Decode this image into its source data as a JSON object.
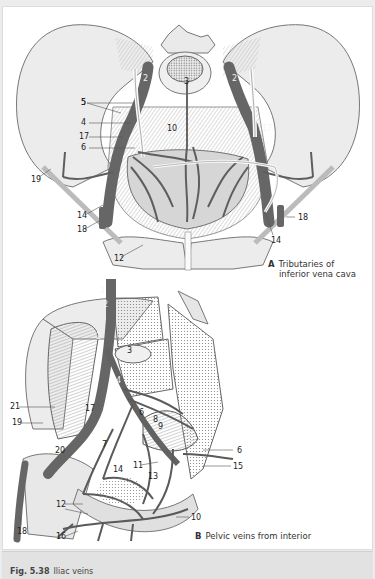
{
  "figure": {
    "caption": {
      "number": "Fig. 5.38",
      "title": "Iliac veins"
    }
  },
  "panel_a": {
    "letter": "A",
    "title_line1": "Tributaries of",
    "title_line2": "inferior vena cava",
    "labels": [
      {
        "text": "2",
        "x": 140,
        "y": 68,
        "inv": true
      },
      {
        "text": "2",
        "x": 229,
        "y": 68,
        "inv": true
      },
      {
        "text": "3",
        "x": 181,
        "y": 71,
        "inv": false
      },
      {
        "text": "5",
        "x": 78,
        "y": 92,
        "inv": false
      },
      {
        "text": "5",
        "x": 78,
        "y": 92,
        "inv": false
      },
      {
        "text": "4",
        "x": 78,
        "y": 112,
        "inv": false
      },
      {
        "text": "4",
        "x": 230,
        "y": 106,
        "inv": true
      },
      {
        "text": "10",
        "x": 164,
        "y": 118,
        "inv": false
      },
      {
        "text": "17",
        "x": 76,
        "y": 126,
        "inv": false
      },
      {
        "text": "17",
        "x": 259,
        "y": 118,
        "inv": true
      },
      {
        "text": "11",
        "x": 164,
        "y": 131,
        "inv": true
      },
      {
        "text": "6",
        "x": 78,
        "y": 137,
        "inv": false
      },
      {
        "text": "19",
        "x": 28,
        "y": 169,
        "inv": false
      },
      {
        "text": "14",
        "x": 74,
        "y": 205,
        "inv": false
      },
      {
        "text": "18",
        "x": 74,
        "y": 219,
        "inv": false
      },
      {
        "text": "18",
        "x": 295,
        "y": 207,
        "inv": false
      },
      {
        "text": "14",
        "x": 268,
        "y": 230,
        "inv": false
      },
      {
        "text": "12",
        "x": 111,
        "y": 248,
        "inv": false
      }
    ]
  },
  "panel_b": {
    "letter": "B",
    "title": "Pelvic veins from interior",
    "labels": [
      {
        "text": "1",
        "x": 97,
        "y": 8,
        "inv": true
      },
      {
        "text": "2",
        "x": 100,
        "y": 22,
        "inv": true
      },
      {
        "text": "2",
        "x": 93,
        "y": 54,
        "inv": true
      },
      {
        "text": "3",
        "x": 124,
        "y": 68,
        "inv": false
      },
      {
        "text": "4",
        "x": 113,
        "y": 98,
        "inv": true
      },
      {
        "text": "21",
        "x": 7,
        "y": 124,
        "inv": false
      },
      {
        "text": "17",
        "x": 82,
        "y": 126,
        "inv": false
      },
      {
        "text": "6",
        "x": 136,
        "y": 130,
        "inv": false
      },
      {
        "text": "8",
        "x": 150,
        "y": 137,
        "inv": false
      },
      {
        "text": "9",
        "x": 155,
        "y": 144,
        "inv": false
      },
      {
        "text": "19",
        "x": 9,
        "y": 140,
        "inv": false
      },
      {
        "text": "7",
        "x": 99,
        "y": 162,
        "inv": false
      },
      {
        "text": "20",
        "x": 52,
        "y": 168,
        "inv": false
      },
      {
        "text": "6",
        "x": 234,
        "y": 168,
        "inv": false
      },
      {
        "text": "11",
        "x": 130,
        "y": 183,
        "inv": false
      },
      {
        "text": "14",
        "x": 110,
        "y": 187,
        "inv": false
      },
      {
        "text": "15",
        "x": 230,
        "y": 184,
        "inv": false
      },
      {
        "text": "13",
        "x": 145,
        "y": 194,
        "inv": false
      },
      {
        "text": "12",
        "x": 53,
        "y": 222,
        "inv": false
      },
      {
        "text": "10",
        "x": 188,
        "y": 235,
        "inv": false
      },
      {
        "text": "18",
        "x": 14,
        "y": 249,
        "inv": false
      },
      {
        "text": "16",
        "x": 53,
        "y": 254,
        "inv": false
      }
    ]
  },
  "colors": {
    "page_bg": "#ececec",
    "panel_bg": "#ffffff",
    "bone": "#e8e8e8",
    "vein": "#6a6a6a",
    "caption_bar": "#e2e2e2"
  }
}
